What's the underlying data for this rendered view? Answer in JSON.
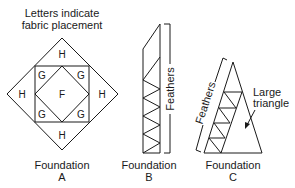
{
  "header": {
    "line1": "Letters indicate",
    "line2": "fabric placement"
  },
  "foundation_a": {
    "title": "Foundation",
    "letter": "A",
    "pieces": {
      "top": "H",
      "left": "H",
      "right": "H",
      "bottom": "H",
      "center": "F",
      "corner_tl": "G",
      "corner_tr": "G",
      "corner_bl": "G",
      "corner_br": "G"
    }
  },
  "foundation_b": {
    "title": "Foundation",
    "letter": "B",
    "bracket_label": "Feathers"
  },
  "foundation_c": {
    "title": "Foundation",
    "letter": "C",
    "bracket_label": "Feathers",
    "callout_line1": "Large",
    "callout_line2": "triangle"
  },
  "colors": {
    "line": "#1a1a1a",
    "background": "#ffffff"
  }
}
